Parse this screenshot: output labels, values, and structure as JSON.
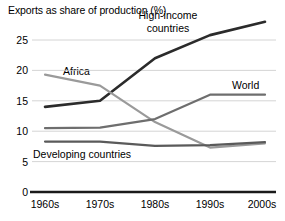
{
  "chart_data": {
    "type": "line",
    "title": "",
    "ylabel": "Exports as share of production (%)",
    "xlabel": "",
    "categories": [
      "1960s",
      "1970s",
      "1980s",
      "1990s",
      "2000s"
    ],
    "ylim": [
      0,
      27
    ],
    "yticks": [
      0,
      5,
      10,
      15,
      20,
      25
    ],
    "grid": true,
    "legend": "inline-labels",
    "series": [
      {
        "name": "High-income countries",
        "values": [
          14.0,
          15.0,
          22.0,
          25.8,
          28.0
        ],
        "color": "#2b2b2b",
        "label": "High-income\ncountries"
      },
      {
        "name": "Africa",
        "values": [
          19.3,
          17.5,
          11.5,
          7.3,
          8.0
        ],
        "color": "#9a9a9a",
        "label": "Africa"
      },
      {
        "name": "World",
        "values": [
          10.5,
          10.6,
          12.0,
          16.0,
          16.0
        ],
        "color": "#6e6e6e",
        "label": "World"
      },
      {
        "name": "Developing countries",
        "values": [
          8.3,
          8.3,
          7.6,
          7.7,
          8.2
        ],
        "color": "#5a5a5a",
        "label": "Developing countries"
      }
    ],
    "axis_labels": {
      "y0": "0",
      "y5": "5",
      "y10": "10",
      "y15": "15",
      "y20": "20",
      "y25": "25"
    }
  }
}
